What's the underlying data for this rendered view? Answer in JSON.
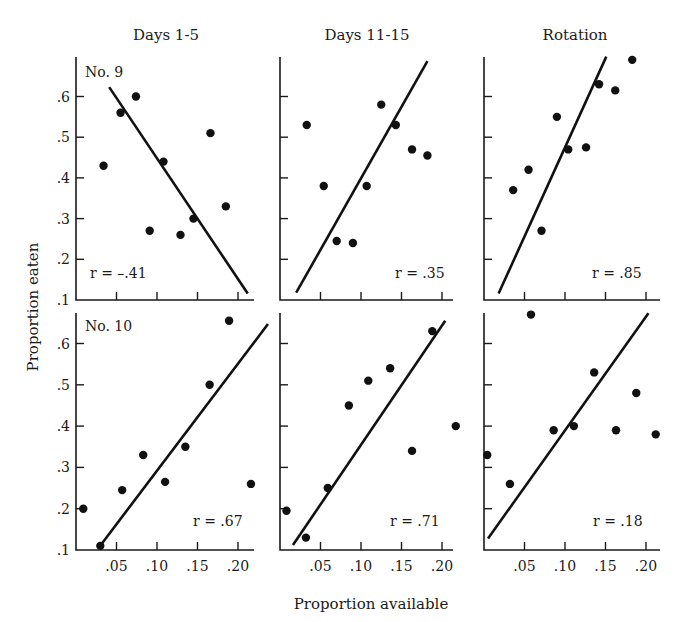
{
  "chart_data": {
    "type": "scatter",
    "layout": "2x3 grid of scatter panels with fitted regression lines",
    "column_titles": [
      "Days 1-5",
      "Days 11-15",
      "Rotation"
    ],
    "row_labels": [
      "No. 9",
      "No. 10"
    ],
    "xlabel": "Proportion available",
    "ylabel": "Proportion eaten",
    "x_ticks": [
      0.05,
      0.1,
      0.15,
      0.2
    ],
    "x_tick_labels": [
      ".05",
      ".10",
      ".15",
      ".20"
    ],
    "y_ticks": [
      0.1,
      0.2,
      0.3,
      0.4,
      0.5,
      0.6
    ],
    "y_tick_labels": [
      ".1",
      ".2",
      ".3",
      ".4",
      ".5",
      ".6"
    ],
    "xlim": [
      0,
      0.22
    ],
    "ylim": [
      0.1,
      0.7
    ],
    "grid": false,
    "panels": [
      {
        "row": 0,
        "col": 0,
        "label": "No. 9",
        "r_label": "r = -.41",
        "r": -0.41,
        "points": [
          [
            0.034,
            0.43
          ],
          [
            0.055,
            0.56
          ],
          [
            0.074,
            0.6
          ],
          [
            0.091,
            0.27
          ],
          [
            0.108,
            0.44
          ],
          [
            0.129,
            0.26
          ],
          [
            0.145,
            0.3
          ],
          [
            0.166,
            0.51
          ],
          [
            0.185,
            0.33
          ]
        ],
        "fit_line": [
          [
            0.041,
            0.623
          ],
          [
            0.212,
            0.116
          ]
        ]
      },
      {
        "row": 0,
        "col": 1,
        "label": "",
        "r_label": "r = .35",
        "r": 0.35,
        "points": [
          [
            0.033,
            0.53
          ],
          [
            0.054,
            0.38
          ],
          [
            0.07,
            0.245
          ],
          [
            0.09,
            0.24
          ],
          [
            0.107,
            0.38
          ],
          [
            0.125,
            0.58
          ],
          [
            0.143,
            0.53
          ],
          [
            0.163,
            0.47
          ],
          [
            0.182,
            0.455
          ]
        ],
        "fit_line": [
          [
            0.02,
            0.118
          ],
          [
            0.182,
            0.687
          ]
        ]
      },
      {
        "row": 0,
        "col": 2,
        "label": "",
        "r_label": "r = .85",
        "r": 0.85,
        "points": [
          [
            0.036,
            0.37
          ],
          [
            0.055,
            0.42
          ],
          [
            0.071,
            0.27
          ],
          [
            0.09,
            0.55
          ],
          [
            0.104,
            0.47
          ],
          [
            0.126,
            0.475
          ],
          [
            0.142,
            0.63
          ],
          [
            0.162,
            0.615
          ],
          [
            0.183,
            0.69
          ]
        ],
        "fit_line": [
          [
            0.018,
            0.116
          ],
          [
            0.151,
            0.698
          ]
        ]
      },
      {
        "row": 1,
        "col": 0,
        "label": "No. 10",
        "r_label": "r = .67",
        "r": 0.67,
        "points": [
          [
            0.009,
            0.2
          ],
          [
            0.03,
            0.11
          ],
          [
            0.057,
            0.245
          ],
          [
            0.083,
            0.33
          ],
          [
            0.11,
            0.265
          ],
          [
            0.135,
            0.35
          ],
          [
            0.165,
            0.5
          ],
          [
            0.189,
            0.655
          ],
          [
            0.216,
            0.26
          ]
        ],
        "fit_line": [
          [
            0.029,
            0.108
          ],
          [
            0.237,
            0.647
          ]
        ]
      },
      {
        "row": 1,
        "col": 1,
        "label": "",
        "r_label": "r = .71",
        "r": 0.71,
        "points": [
          [
            0.008,
            0.195
          ],
          [
            0.032,
            0.13
          ],
          [
            0.059,
            0.25
          ],
          [
            0.085,
            0.45
          ],
          [
            0.109,
            0.51
          ],
          [
            0.136,
            0.54
          ],
          [
            0.163,
            0.34
          ],
          [
            0.188,
            0.63
          ],
          [
            0.217,
            0.4
          ]
        ],
        "fit_line": [
          [
            0.016,
            0.112
          ],
          [
            0.204,
            0.655
          ]
        ]
      },
      {
        "row": 1,
        "col": 2,
        "label": "",
        "r_label": "r = .18",
        "r": 0.18,
        "points": [
          [
            0.004,
            0.33
          ],
          [
            0.032,
            0.26
          ],
          [
            0.058,
            0.67
          ],
          [
            0.086,
            0.39
          ],
          [
            0.111,
            0.4
          ],
          [
            0.136,
            0.53
          ],
          [
            0.163,
            0.39
          ],
          [
            0.188,
            0.48
          ],
          [
            0.212,
            0.38
          ]
        ],
        "fit_line": [
          [
            0.005,
            0.128
          ],
          [
            0.203,
            0.673
          ]
        ]
      }
    ]
  }
}
